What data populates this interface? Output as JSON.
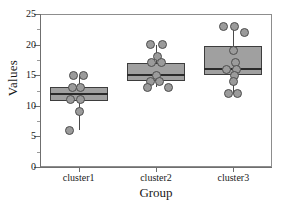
{
  "chart_data": {
    "type": "box",
    "title": "",
    "xlabel": "Group",
    "ylabel": "Values",
    "categories": [
      "cluster1",
      "cluster2",
      "cluster3"
    ],
    "ylim": [
      0,
      25
    ],
    "yticks": [
      0,
      5,
      10,
      15,
      20,
      25
    ],
    "ytick_labels": [
      "0",
      "5",
      "10",
      "15",
      "20",
      "25"
    ],
    "grid": false,
    "legend": "none",
    "colors": {
      "box_fill": "#a0a0a0",
      "box_edge": "#3d3d3d",
      "median": "#2b2b2b",
      "point_fill": "#9b9b9b",
      "point_edge": "#4d4d4d",
      "axis": "#6f6f6f",
      "text": "#1a1a1a",
      "background": "#ffffff"
    },
    "boxes": [
      {
        "category": "cluster1",
        "min": 6,
        "q1": 10.8,
        "median": 12,
        "q3": 13,
        "max": 15,
        "points": [
          15,
          15,
          13,
          13,
          11,
          11,
          9,
          6
        ]
      },
      {
        "category": "cluster2",
        "min": 13,
        "q1": 14,
        "median": 15,
        "q3": 17,
        "max": 20,
        "points": [
          20,
          20,
          18,
          17,
          17,
          15,
          14,
          14,
          13,
          13
        ]
      },
      {
        "category": "cluster3",
        "min": 12,
        "q1": 15,
        "median": 16,
        "q3": 19.7,
        "max": 23,
        "points": [
          23,
          23,
          22,
          19,
          17,
          16,
          16,
          15,
          14,
          12,
          12
        ]
      }
    ]
  },
  "axis": {
    "y_title": "Values",
    "x_title": "Group",
    "y_tick_0": "0",
    "y_tick_1": "5",
    "y_tick_2": "10",
    "y_tick_3": "15",
    "y_tick_4": "20",
    "y_tick_5": "25",
    "x_tick_0": "cluster1",
    "x_tick_1": "cluster2",
    "x_tick_2": "cluster3"
  }
}
